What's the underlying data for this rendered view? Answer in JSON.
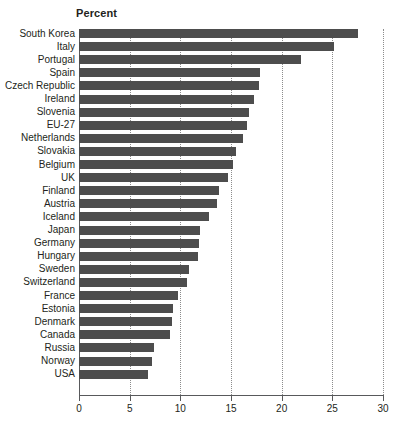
{
  "chart_data": {
    "type": "bar",
    "orientation": "horizontal",
    "title": "Percent",
    "xlabel": "",
    "ylabel": "",
    "xlim": [
      0,
      30
    ],
    "xticks": [
      0,
      5,
      10,
      15,
      20,
      25,
      30
    ],
    "xtick_labels": [
      "0",
      "5",
      "10",
      "15",
      "20",
      "25",
      "30"
    ],
    "grid": "vertical dotted gridlines at each x tick",
    "legend": "none",
    "bar_color": "#4d4d4d",
    "categories": [
      "South Korea",
      "Italy",
      "Portugal",
      "Spain",
      "Czech Republic",
      "Ireland",
      "Slovenia",
      "EU-27",
      "Netherlands",
      "Slovakia",
      "Belgium",
      "UK",
      "Finland",
      "Austria",
      "Iceland",
      "Japan",
      "Germany",
      "Hungary",
      "Sweden",
      "Switzerland",
      "France",
      "Estonia",
      "Denmark",
      "Canada",
      "Russia",
      "Norway",
      "USA"
    ],
    "values": [
      27.5,
      25.2,
      21.9,
      17.9,
      17.8,
      17.3,
      16.8,
      16.6,
      16.2,
      15.5,
      15.2,
      14.7,
      13.8,
      13.6,
      12.8,
      11.9,
      11.8,
      11.7,
      10.9,
      10.7,
      9.8,
      9.3,
      9.2,
      9.0,
      7.4,
      7.2,
      6.8
    ]
  }
}
